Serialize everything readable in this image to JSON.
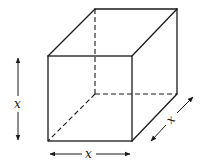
{
  "diagram": {
    "type": "cube",
    "colors": {
      "stroke": "#1a1a1a",
      "background": "#ffffff"
    },
    "labels": {
      "height": "x",
      "width": "x",
      "depth": "x"
    },
    "vertices": {
      "front_top_left": [
        48,
        56
      ],
      "front_top_right": [
        132,
        56
      ],
      "front_bottom_left": [
        48,
        141
      ],
      "front_bottom_right": [
        132,
        141
      ],
      "back_top_left": [
        95,
        9
      ],
      "back_top_right": [
        177,
        9
      ],
      "back_bottom_left": [
        95,
        94
      ],
      "back_bottom_right": [
        177,
        94
      ]
    }
  }
}
